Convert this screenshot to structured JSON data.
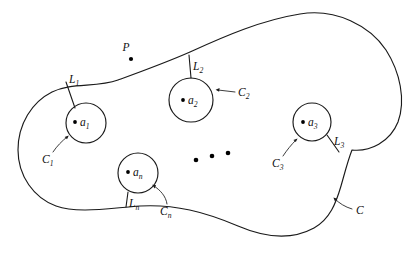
{
  "figure": {
    "outer_boundary_label": "C",
    "marked_point_label": "P",
    "ellipsis": "• • •",
    "holes": [
      {
        "center_label": "a",
        "center_sub": "1",
        "circle_label": "C",
        "circle_sub": "1",
        "cut_label": "L",
        "cut_sub": "1"
      },
      {
        "center_label": "a",
        "center_sub": "2",
        "circle_label": "C",
        "circle_sub": "2",
        "cut_label": "L",
        "cut_sub": "2"
      },
      {
        "center_label": "a",
        "center_sub": "3",
        "circle_label": "C",
        "circle_sub": "3",
        "cut_label": "L",
        "cut_sub": "3"
      },
      {
        "center_label": "a",
        "center_sub": "n",
        "circle_label": "C",
        "circle_sub": "n",
        "cut_label": "L",
        "cut_sub": "n"
      }
    ],
    "colors": {
      "ink": "#1a1a1a",
      "background": "#ffffff"
    }
  }
}
